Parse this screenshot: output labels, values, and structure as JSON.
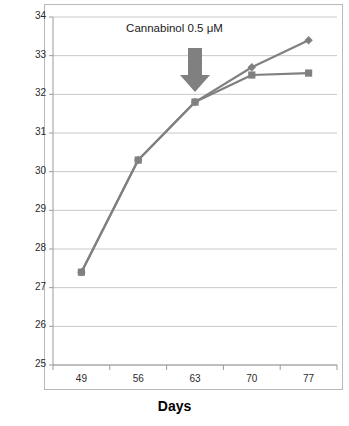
{
  "chart_data": {
    "type": "line",
    "title": "",
    "xlabel": "Days",
    "ylabel": "",
    "categories": [
      49,
      56,
      63,
      70,
      77
    ],
    "x": [
      49,
      56,
      63,
      70,
      77
    ],
    "xlim": [
      45.5,
      80.5
    ],
    "ylim": [
      25,
      34
    ],
    "y_ticks": [
      25,
      26,
      27,
      28,
      29,
      30,
      31,
      32,
      33,
      34
    ],
    "x_ticks": [
      49,
      56,
      63,
      70,
      77
    ],
    "grid": "horizontal",
    "legend": "none",
    "series": [
      {
        "name": "control",
        "marker": "diamond",
        "color": "#808080",
        "values": [
          27.4,
          30.3,
          31.8,
          32.7,
          33.4
        ]
      },
      {
        "name": "treated",
        "marker": "square",
        "color": "#808080",
        "values": [
          27.4,
          30.3,
          31.8,
          32.5,
          32.55
        ]
      }
    ],
    "annotations": [
      {
        "text": "Cannabinol 0.5 μM",
        "marker": "down-arrow",
        "at_x": 63,
        "color": "#808080"
      }
    ]
  },
  "axes": {
    "y_tick_labels": [
      "34",
      "33",
      "32",
      "31",
      "30",
      "29",
      "28",
      "27",
      "26",
      "25"
    ],
    "x_tick_labels": [
      "49",
      "56",
      "63",
      "70",
      "77"
    ],
    "x_title": "Days"
  },
  "annotation": {
    "text": "Cannabinol 0.5 μM"
  },
  "colors": {
    "series": "#808080",
    "arrow": "#808080",
    "grid": "#c8c8c8",
    "axis": "#9a9a9a",
    "frame": "#b9b9b9",
    "text": "#2b2b2b"
  }
}
